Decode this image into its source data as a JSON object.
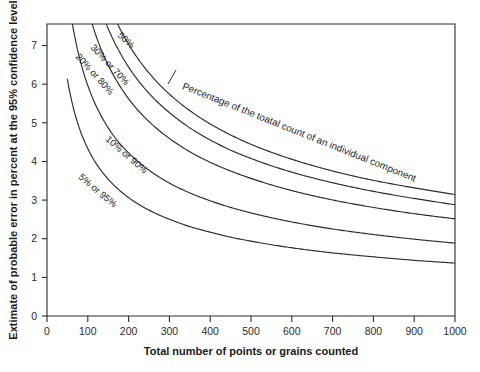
{
  "chart_data": {
    "type": "line",
    "title": "",
    "xlabel": "Total number of points or grains counted",
    "ylabel": "Extimate of probable error in percent at the 95% confidence level",
    "xlim": [
      0,
      1000
    ],
    "ylim": [
      0,
      7.45
    ],
    "grid": false,
    "legend_position": "inline-curve-labels",
    "xticks": [
      "0",
      "100",
      "200",
      "300",
      "400",
      "500",
      "600",
      "700",
      "800",
      "900",
      "1000"
    ],
    "yticks": [
      "0",
      "1",
      "2",
      "3",
      "4",
      "5",
      "6",
      "7"
    ],
    "annotations": [
      {
        "name": "curve-family-annotation",
        "text": "Percentage of the toatal count of an individual component",
        "points_to": "50%"
      }
    ],
    "series": [
      {
        "name": "50%",
        "label": "50%",
        "p": 0.5,
        "x": [
          40,
          50,
          60,
          80,
          100,
          125,
          150,
          175,
          200,
          250,
          300,
          350,
          400,
          450,
          500,
          600,
          700,
          800,
          900,
          1000
        ],
        "values": [
          15.5,
          13.86,
          12.65,
          10.96,
          9.8,
          8.77,
          8.0,
          7.41,
          6.93,
          6.2,
          5.66,
          5.24,
          4.9,
          4.62,
          4.38,
          4.0,
          3.7,
          3.46,
          3.27,
          3.1
        ]
      },
      {
        "name": "30% or 70%",
        "label": "30% or 70%",
        "p": 0.3,
        "x": [
          40,
          50,
          60,
          80,
          100,
          125,
          150,
          175,
          200,
          250,
          300,
          350,
          400,
          450,
          500,
          600,
          700,
          800,
          900,
          1000
        ],
        "values": [
          14.2,
          12.7,
          11.6,
          10.04,
          8.98,
          8.03,
          7.33,
          6.79,
          6.35,
          5.68,
          5.19,
          4.8,
          4.49,
          4.23,
          4.02,
          3.67,
          3.4,
          3.18,
          3.0,
          2.84
        ]
      },
      {
        "name": "20% or 80%",
        "label": "20% or 80%",
        "p": 0.2,
        "x": [
          40,
          50,
          60,
          80,
          100,
          125,
          150,
          175,
          200,
          250,
          300,
          350,
          400,
          450,
          500,
          600,
          700,
          800,
          900,
          1000
        ],
        "values": [
          12.4,
          11.09,
          10.12,
          8.77,
          7.84,
          7.01,
          6.4,
          5.93,
          5.54,
          4.96,
          4.53,
          4.19,
          3.92,
          3.7,
          3.51,
          3.2,
          2.96,
          2.77,
          2.61,
          2.48
        ]
      },
      {
        "name": "10% or 90%",
        "label": "10% or 90%",
        "p": 0.1,
        "x": [
          40,
          50,
          60,
          80,
          100,
          125,
          150,
          175,
          200,
          250,
          300,
          350,
          400,
          450,
          500,
          600,
          700,
          800,
          900,
          1000
        ],
        "values": [
          9.3,
          8.32,
          7.59,
          6.57,
          5.88,
          5.26,
          4.8,
          4.44,
          4.16,
          3.72,
          3.39,
          3.14,
          2.94,
          2.77,
          2.63,
          2.4,
          2.22,
          2.08,
          1.96,
          1.86
        ]
      },
      {
        "name": "5% or 95%",
        "label": "5% or 95%",
        "p": 0.05,
        "x": [
          50,
          60,
          80,
          100,
          125,
          150,
          175,
          200,
          250,
          300,
          350,
          400,
          450,
          500,
          600,
          700,
          800,
          900,
          1000
        ],
        "values": [
          6.04,
          5.51,
          4.77,
          4.27,
          3.82,
          3.49,
          3.23,
          3.02,
          2.7,
          2.47,
          2.28,
          2.14,
          2.01,
          1.91,
          1.74,
          1.61,
          1.51,
          1.42,
          1.35
        ]
      }
    ]
  },
  "labels": {
    "curve_50": "50%",
    "curve_30_70": "30% or 70%",
    "curve_20_80": "20% or 80%",
    "curve_10_90": "10% or 90%",
    "curve_5_95": "5% or 95%",
    "annotation": "Percentage of the toatal count of an individual component",
    "x_title": "Total number of points or grains counted",
    "y_title": "Extimate of probable error in percent at the 95% confidence level",
    "x0": "0",
    "x100": "100",
    "x200": "200",
    "x300": "300",
    "x400": "400",
    "x500": "500",
    "x600": "600",
    "x700": "700",
    "x800": "800",
    "x900": "900",
    "x1000": "1000",
    "y0": "0",
    "y1": "1",
    "y2": "2",
    "y3": "3",
    "y4": "4",
    "y5": "5",
    "y6": "6",
    "y7": "7"
  },
  "colors": {
    "background": "#ffffff",
    "axis": "#2b2b2b",
    "curve": "#2b2b2b",
    "text": "#1a1a1a"
  }
}
